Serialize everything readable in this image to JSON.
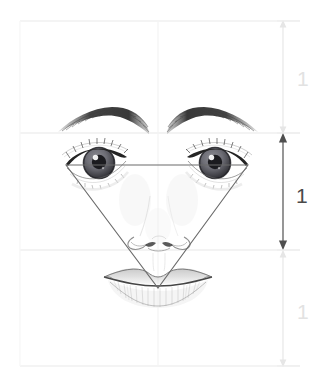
{
  "figure": {
    "width": 321,
    "height": 386,
    "background": "#ffffff"
  },
  "colors": {
    "grid_line": "#f2f2f2",
    "guide_line": "#f4f4f4",
    "triangle_stroke": "#6b6b6b",
    "arrow_active": "#5a5a5a",
    "arrow_faint": "#ededed",
    "label_active": "#4a4a4a",
    "label_faint": "#e2e2e2",
    "pencil_dark": "#2b2b2b",
    "pencil_mid": "#6e6e6e",
    "pencil_light": "#bdbdbd"
  },
  "grid": {
    "horizontal_lines": [
      {
        "name": "hairline-top",
        "y": 21
      },
      {
        "name": "brow-line",
        "y": 133
      },
      {
        "name": "nose-base-line",
        "y": 250
      },
      {
        "name": "chin-line",
        "y": 366
      }
    ],
    "vertical_lines": [
      {
        "name": "left-margin-line",
        "x": 20
      },
      {
        "name": "center-axis-line",
        "x": 158
      },
      {
        "name": "right-margin-line",
        "x": 283
      }
    ]
  },
  "triangle": {
    "name": "inverted-triangle",
    "vertices": [
      {
        "label": "left-eye-outer",
        "x": 66,
        "y": 165
      },
      {
        "label": "right-eye-outer",
        "x": 248,
        "y": 165
      },
      {
        "label": "mouth-center",
        "x": 158,
        "y": 288
      }
    ]
  },
  "dimensions": {
    "axis_x": 283,
    "segments": [
      {
        "name": "upper-third",
        "label": "1",
        "y_top": 21,
        "y_bottom": 133,
        "label_y": 79,
        "emphasis": "faint"
      },
      {
        "name": "middle-third",
        "label": "1",
        "y_top": 133,
        "y_bottom": 250,
        "label_y": 196,
        "emphasis": "active"
      },
      {
        "name": "lower-third",
        "label": "1",
        "y_top": 250,
        "y_bottom": 366,
        "label_y": 312,
        "emphasis": "faint"
      }
    ]
  },
  "face": {
    "parts": [
      {
        "name": "left-eyebrow"
      },
      {
        "name": "right-eyebrow"
      },
      {
        "name": "left-eye"
      },
      {
        "name": "right-eye"
      },
      {
        "name": "nose"
      },
      {
        "name": "upper-lip"
      },
      {
        "name": "lower-lip"
      }
    ]
  }
}
